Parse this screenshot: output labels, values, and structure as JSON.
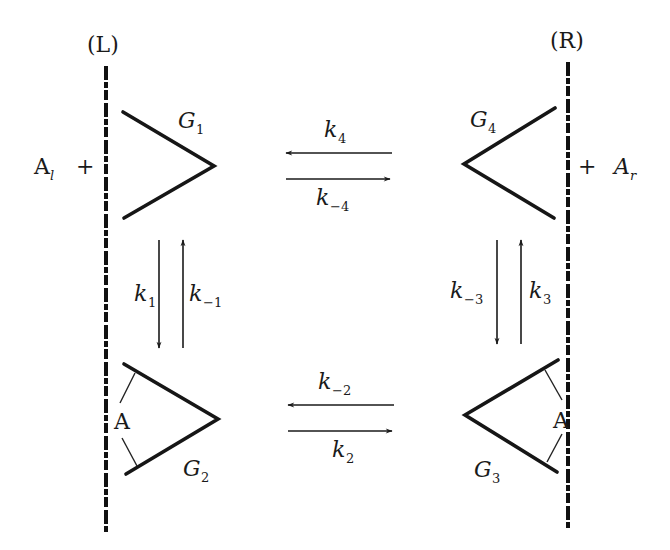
{
  "diagram": {
    "sides": {
      "left": {
        "label": "(L)",
        "substrate": "A",
        "substrate_sub": "l",
        "plus": "+"
      },
      "right": {
        "label": "(R)",
        "substrate": "A",
        "substrate_sub": "r",
        "plus": "+"
      }
    },
    "states": [
      {
        "id": "G1",
        "base": "G",
        "sub": "1",
        "position": "top-left",
        "bound": false
      },
      {
        "id": "G2",
        "base": "G",
        "sub": "2",
        "position": "bottom-left",
        "bound": true,
        "ligand": "A"
      },
      {
        "id": "G3",
        "base": "G",
        "sub": "3",
        "position": "bottom-right",
        "bound": true,
        "ligand": "A"
      },
      {
        "id": "G4",
        "base": "G",
        "sub": "4",
        "position": "top-right",
        "bound": false
      }
    ],
    "rate_constants": {
      "k1": {
        "base": "k",
        "sub": "1",
        "from": "G1",
        "to": "G2"
      },
      "k_1": {
        "base": "k",
        "sub": "−1",
        "from": "G2",
        "to": "G1"
      },
      "k2": {
        "base": "k",
        "sub": "2",
        "from": "G2",
        "to": "G3"
      },
      "k_2": {
        "base": "k",
        "sub": "−2",
        "from": "G3",
        "to": "G2"
      },
      "k3": {
        "base": "k",
        "sub": "3",
        "from": "G3",
        "to": "G4"
      },
      "k_3": {
        "base": "k",
        "sub": "−3",
        "from": "G4",
        "to": "G3"
      },
      "k4": {
        "base": "k",
        "sub": "4",
        "from": "G4",
        "to": "G1"
      },
      "k_4": {
        "base": "k",
        "sub": "−4",
        "from": "G1",
        "to": "G4"
      }
    },
    "colors": {
      "ink": "#1a1a1a",
      "background": "#ffffff"
    }
  }
}
